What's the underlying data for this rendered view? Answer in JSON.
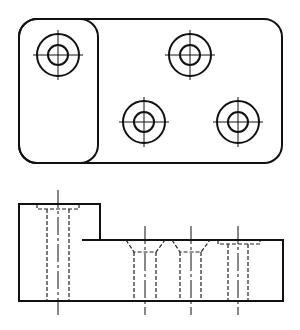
{
  "drawing": {
    "type": "orthographic technical drawing",
    "views": [
      "top-view",
      "front-view"
    ],
    "colors": {
      "line": "#111111",
      "background": "#ffffff"
    },
    "top_view": {
      "outline": {
        "x": 19,
        "y": 19,
        "w": 263,
        "h": 144,
        "r": 18
      },
      "left_pad": {
        "x": 19,
        "y": 19,
        "w": 79,
        "h": 144,
        "r": 18
      },
      "holes": [
        {
          "cx": 58,
          "cy": 55,
          "r_outer": 21,
          "r_inner": 10
        },
        {
          "cx": 190,
          "cy": 55,
          "r_outer": 21,
          "r_inner": 10
        },
        {
          "cx": 144,
          "cy": 122,
          "r_outer": 21,
          "r_inner": 10
        },
        {
          "cx": 238,
          "cy": 122,
          "r_outer": 21,
          "r_inner": 10
        }
      ]
    },
    "front_view": {
      "left": 19,
      "right": 283,
      "top_high": 204,
      "top_low": 240,
      "step_x": 100,
      "bottom": 301,
      "holes": [
        {
          "cx": 58,
          "type": "counterbore",
          "cb_left": 37,
          "cb_right": 79,
          "top": 204,
          "depth": 5,
          "wall_left": 47,
          "wall_right": 69
        },
        {
          "cx": 145,
          "type": "countersink",
          "cs_left": 126,
          "cs_right": 165,
          "top": 240,
          "cone_bottom": 252,
          "wall_left": 134,
          "wall_right": 156
        },
        {
          "cx": 191,
          "type": "countersink",
          "cs_left": 172,
          "cs_right": 210,
          "top": 240,
          "cone_bottom": 252,
          "wall_left": 180,
          "wall_right": 201
        },
        {
          "cx": 238,
          "type": "counterbore",
          "cb_left": 218,
          "cb_right": 260,
          "top": 240,
          "depth": 4,
          "wall_left": 228,
          "wall_right": 248
        }
      ]
    }
  }
}
